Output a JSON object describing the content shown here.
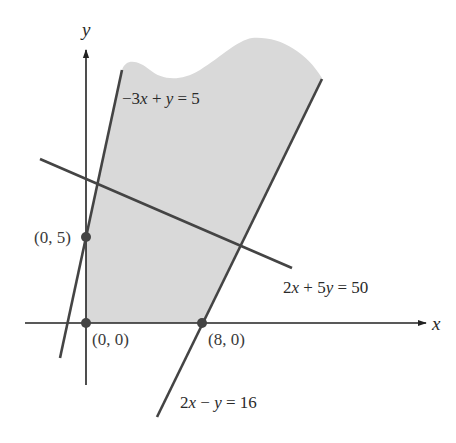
{
  "figure": {
    "type": "feasible-region-diagram",
    "axes": {
      "x_label": "x",
      "y_label": "y"
    },
    "constraint_lines": [
      {
        "id": "line-1",
        "equation": "−3x + y = 5",
        "parts": [
          {
            "t": "−3"
          },
          {
            "t": "x",
            "i": true
          },
          {
            "t": " + "
          },
          {
            "t": "y",
            "i": true
          },
          {
            "t": " = 5"
          }
        ],
        "a": -3,
        "b": 1,
        "c": 5
      },
      {
        "id": "line-2",
        "equation": "2x + 5y = 50",
        "parts": [
          {
            "t": "2"
          },
          {
            "t": "x",
            "i": true
          },
          {
            "t": " + 5"
          },
          {
            "t": "y",
            "i": true
          },
          {
            "t": " = 50"
          }
        ],
        "a": 2,
        "b": 5,
        "c": 50
      },
      {
        "id": "line-3",
        "equation": "2x − y = 16",
        "parts": [
          {
            "t": "2"
          },
          {
            "t": "x",
            "i": true
          },
          {
            "t": " − "
          },
          {
            "t": "y",
            "i": true
          },
          {
            "t": " = 16"
          }
        ],
        "a": 2,
        "b": -1,
        "c": 16
      }
    ],
    "points": [
      {
        "label": "(0, 5)",
        "x": 0,
        "y": 5
      },
      {
        "label": "(0, 0)",
        "x": 0,
        "y": 0
      },
      {
        "label": "(8, 0)",
        "x": 8,
        "y": 0
      }
    ],
    "shaded_region": "unbounded region with x ≥ 0, y ≥ 0, −3x + y ≤ 5, 2x − y ≤ 16",
    "colors": {
      "shade": "#d9d9d9",
      "line": "#444444",
      "axis": "#222222",
      "point": "#444444"
    }
  }
}
